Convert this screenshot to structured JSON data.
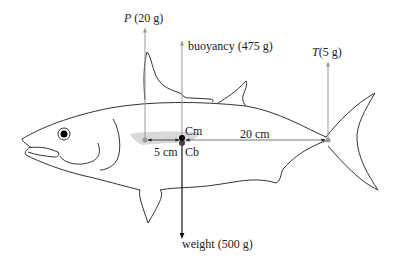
{
  "diagram": {
    "labels": {
      "pectoral_force_symbol": "P",
      "pectoral_force_value": "(20 g)",
      "buoyancy": "buoyancy (475 g)",
      "tail_force_symbol": "T",
      "tail_force_value": "(5 g)",
      "center_of_mass": "Cm",
      "center_of_buoyancy": "Cb",
      "distance_pectoral": "5 cm",
      "distance_tail": "20 cm",
      "weight": "weight (500 g)"
    },
    "forces": [
      {
        "name": "P",
        "value_g": 20,
        "direction": "up",
        "color": "#999999"
      },
      {
        "name": "buoyancy",
        "value_g": 475,
        "direction": "up",
        "color": "#999999"
      },
      {
        "name": "T",
        "value_g": 5,
        "direction": "up",
        "color": "#999999"
      },
      {
        "name": "weight",
        "value_g": 500,
        "direction": "down",
        "color": "#111111"
      }
    ],
    "distances": [
      {
        "from": "P",
        "to": "Cm",
        "value_cm": 5
      },
      {
        "from": "Cm",
        "to": "T",
        "value_cm": 20
      }
    ],
    "colors": {
      "outline": "#333333",
      "force_arrow": "#999999",
      "weight_arrow": "#111111",
      "shading": "#d9d9d9",
      "point_dark": "#000000",
      "point_grey": "#9a9a9a"
    }
  }
}
